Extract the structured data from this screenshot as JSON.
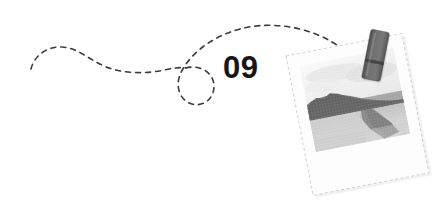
{
  "canvas": {
    "width": 444,
    "height": 216,
    "background_color": "#ffffff"
  },
  "section_marker": {
    "number_label": "09",
    "color": "#161616",
    "position": {
      "x": 223,
      "y": 52
    }
  },
  "dashed_path": {
    "name": "dotted-route-line",
    "color": "#3a3a42",
    "stroke_width": 1.6,
    "dash_pattern": "5 5",
    "description": "hand-drawn dashed route with an S-curve, a small loop, and a long arc ending at the clothespin"
  },
  "clothespin": {
    "name": "clothespin",
    "color": "#6a6a6a",
    "shadow_color": "#4a4a4a",
    "rotation_deg": 11,
    "position": {
      "x": 371,
      "y": 29
    },
    "size": {
      "width": 19,
      "height": 50
    }
  },
  "photo": {
    "name": "hanging-photo",
    "frame_color": "#fdfdfd",
    "border_color": "#c9c9c9",
    "rotation_deg": -11,
    "position": {
      "x": 286,
      "y": 56
    },
    "size": {
      "width": 118,
      "height": 142
    },
    "image": {
      "name": "coastal-landscape-photo",
      "alt_label": "Grayscale coastal landscape with dark ridge and bay",
      "sky_color": "#f2f2f2",
      "ridge_color": "#6d6d6d",
      "water_color": "#c6c6c6",
      "headland_color": "#8c8c8c"
    }
  },
  "colors": {
    "ink": "#161616",
    "line": "#3a3a42",
    "paper": "#ffffff",
    "mid_gray": "#6a6a6a",
    "light_gray": "#c9c9c9"
  }
}
